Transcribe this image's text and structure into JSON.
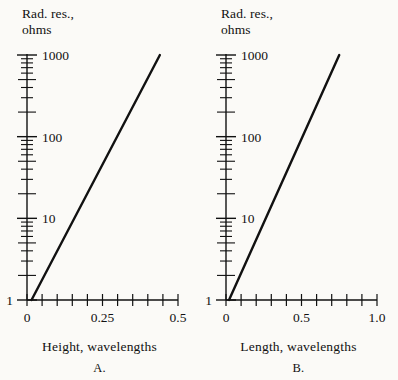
{
  "figure": {
    "background": "#fbfaf7",
    "ink": "#111111",
    "panels": [
      {
        "id": "A",
        "letter": "A.",
        "y_axis_title": "Rad. res.,\nohms",
        "x_axis_label": "Height, wavelengths",
        "y_tick_labels": [
          "1000",
          "100",
          "10",
          "1"
        ],
        "x_tick_labels": [
          "0",
          "0.25",
          "0.5"
        ]
      },
      {
        "id": "B",
        "letter": "B.",
        "y_axis_title": "Rad. res.,\nohms",
        "x_axis_label": "Length, wavelengths",
        "y_tick_labels": [
          "1000",
          "100",
          "10",
          "1"
        ],
        "x_tick_labels": [
          "0",
          "0.5",
          "1.0"
        ]
      }
    ]
  },
  "chart_data": [
    {
      "type": "line",
      "title": "A.",
      "xlabel": "Height, wavelengths",
      "ylabel": "Rad. res., ohms",
      "yscale": "log",
      "xscale": "linear",
      "xlim": [
        0,
        0.5
      ],
      "ylim": [
        1,
        1000
      ],
      "grid": false,
      "legend": null,
      "xticks": [
        0,
        0.05,
        0.1,
        0.15,
        0.2,
        0.25,
        0.3,
        0.35,
        0.4,
        0.45,
        0.5
      ],
      "xticklabels": [
        "0",
        "",
        "",
        "",
        "",
        "0.25",
        "",
        "",
        "",
        "",
        "0.5"
      ],
      "yticks": [
        1,
        10,
        100,
        1000
      ],
      "yticklabels": [
        "1",
        "10",
        "100",
        "1000"
      ],
      "series": [
        {
          "name": "Radiation resistance vs height",
          "x": [
            0.015,
            0.44
          ],
          "y": [
            1,
            1000
          ]
        }
      ]
    },
    {
      "type": "line",
      "title": "B.",
      "xlabel": "Length, wavelengths",
      "ylabel": "Rad. res., ohms",
      "yscale": "log",
      "xscale": "linear",
      "xlim": [
        0,
        1.0
      ],
      "ylim": [
        1,
        1000
      ],
      "grid": false,
      "legend": null,
      "xticks": [
        0,
        0.1,
        0.2,
        0.3,
        0.4,
        0.5,
        0.6,
        0.7,
        0.8,
        0.9,
        1.0
      ],
      "xticklabels": [
        "0",
        "",
        "",
        "",
        "",
        "0.5",
        "",
        "",
        "",
        "",
        "1.0"
      ],
      "yticks": [
        1,
        10,
        100,
        1000
      ],
      "yticklabels": [
        "1",
        "10",
        "100",
        "1000"
      ],
      "series": [
        {
          "name": "Radiation resistance vs length",
          "x": [
            0.02,
            0.75
          ],
          "y": [
            1,
            1000
          ]
        }
      ]
    }
  ]
}
